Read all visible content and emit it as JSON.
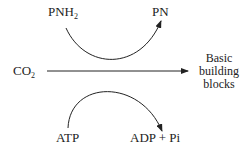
{
  "diagram": {
    "top_reaction": {
      "reactant": {
        "main": "PNH",
        "sub": "2"
      },
      "product": "PN"
    },
    "main_reaction": {
      "substrate": {
        "main": "CO",
        "sub": "2"
      },
      "product_lines": [
        "Basic",
        "building",
        "blocks"
      ]
    },
    "bottom_reaction": {
      "reactant": "ATP",
      "product": "ADP + Pi"
    },
    "colors": {
      "line": "#222222",
      "background": "#ffffff"
    }
  }
}
